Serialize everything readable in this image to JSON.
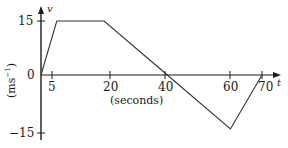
{
  "chart_data": {
    "type": "line",
    "title": "",
    "xlabel": "(seconds)",
    "ylabel": "(ms⁻¹)",
    "x_axis_name": "t",
    "y_axis_name": "v",
    "x": [
      0,
      5,
      20,
      40,
      60,
      70
    ],
    "values": [
      0,
      15,
      15,
      0,
      -15,
      0
    ],
    "series": [
      {
        "name": "velocity",
        "x": [
          0,
          5,
          20,
          40,
          60,
          70
        ],
        "values": [
          0,
          15,
          15,
          0,
          -15,
          0
        ]
      }
    ],
    "xticks": [
      5,
      20,
      40,
      60,
      70
    ],
    "xtick_labels": [
      "5",
      "20",
      "40",
      "60",
      "70"
    ],
    "yticks": [
      15,
      0,
      -15
    ],
    "ytick_labels": [
      "15",
      "0",
      "−15"
    ],
    "xlim": [
      0,
      75
    ],
    "ylim": [
      -17,
      17
    ],
    "grid": false,
    "legend": false,
    "line_color": "#333333"
  },
  "axes": {
    "x_name": "t",
    "y_name": "v",
    "x_caption": "(seconds)",
    "y_unit_main": "(ms",
    "y_unit_sup": "−1",
    "y_unit_close": ")"
  },
  "ticks": {
    "x": [
      {
        "label": "5",
        "value": 5
      },
      {
        "label": "20",
        "value": 20
      },
      {
        "label": "40",
        "value": 40
      },
      {
        "label": "60",
        "value": 60
      },
      {
        "label": "70",
        "value": 70
      }
    ],
    "y": [
      {
        "label": "15",
        "value": 15
      },
      {
        "label": "0",
        "value": 0
      },
      {
        "label": "−15",
        "value": -15
      }
    ]
  },
  "colors": {
    "line": "#333333",
    "axis": "#1a1a1a",
    "text": "#1a1a1a",
    "background": "#ffffff"
  }
}
